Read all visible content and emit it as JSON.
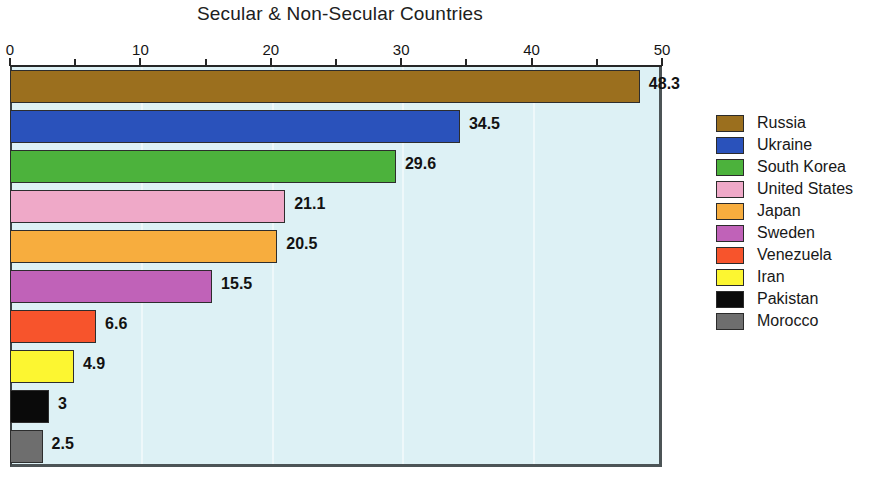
{
  "chart_data": {
    "type": "bar",
    "orientation": "horizontal",
    "title": "Secular & Non-Secular Countries",
    "xlabel": "",
    "ylabel": "",
    "xlim": [
      0,
      50
    ],
    "grid": true,
    "legend_position": "right",
    "x_tick_labels": [
      "0",
      "10",
      "20",
      "30",
      "40",
      "50"
    ],
    "x_tick_values": [
      0,
      10,
      20,
      30,
      40,
      50
    ],
    "x_minor_tick_values": [
      5,
      15,
      25,
      35,
      45
    ],
    "categories": [
      "Russia",
      "Ukraine",
      "South Korea",
      "United States",
      "Japan",
      "Sweden",
      "Venezuela",
      "Iran",
      "Pakistan",
      "Morocco"
    ],
    "values": [
      48.3,
      34.5,
      29.6,
      21.1,
      20.5,
      15.5,
      6.6,
      4.9,
      3,
      2.5
    ],
    "value_labels": [
      "48.3",
      "34.5",
      "29.6",
      "21.1",
      "20.5",
      "15.5",
      "6.6",
      "4.9",
      "3",
      "2.5"
    ],
    "colors": [
      "#9b6f1e",
      "#2a52bb",
      "#4cb23c",
      "#efa9c8",
      "#f7ad3e",
      "#c062b8",
      "#f7542c",
      "#fcf631",
      "#0a0a0a",
      "#6e6e6e"
    ],
    "plot_background": "#ddf1f5",
    "axis_color": "#262626"
  },
  "legend": {
    "items": [
      {
        "label": "Russia",
        "color": "#9b6f1e"
      },
      {
        "label": "Ukraine",
        "color": "#2a52bb"
      },
      {
        "label": "South Korea",
        "color": "#4cb23c"
      },
      {
        "label": "United States",
        "color": "#efa9c8"
      },
      {
        "label": "Japan",
        "color": "#f7ad3e"
      },
      {
        "label": "Sweden",
        "color": "#c062b8"
      },
      {
        "label": "Venezuela",
        "color": "#f7542c"
      },
      {
        "label": "Iran",
        "color": "#fcf631"
      },
      {
        "label": "Pakistan",
        "color": "#0a0a0a"
      },
      {
        "label": "Morocco",
        "color": "#6e6e6e"
      }
    ]
  }
}
